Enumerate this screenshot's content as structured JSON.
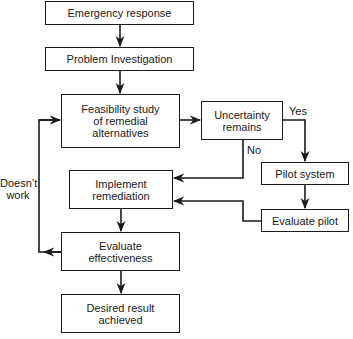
{
  "diagram": {
    "type": "flowchart",
    "nodes": {
      "emergency_response": "Emergency response",
      "problem_investigation": "Problem Investigation",
      "feasibility_study": "Feasibility study\nof remedial\nalternatives",
      "uncertainty_remains": "Uncertainty\nremains",
      "pilot_system": "Pilot system",
      "evaluate_pilot": "Evaluate pilot",
      "implement_remediation": "Implement\nremediation",
      "evaluate_effectiveness": "Evaluate\neffectiveness",
      "desired_result": "Desired result\nachieved"
    },
    "edge_labels": {
      "yes": "Yes",
      "no": "No",
      "doesnt_work": "Doesn’t\nwork"
    },
    "edges": [
      {
        "from": "Emergency response",
        "to": "Problem Investigation"
      },
      {
        "from": "Problem Investigation",
        "to": "Feasibility study of remedial alternatives"
      },
      {
        "from": "Feasibility study of remedial alternatives",
        "to": "Uncertainty remains"
      },
      {
        "from": "Uncertainty remains",
        "to": "Pilot system",
        "label": "Yes"
      },
      {
        "from": "Uncertainty remains",
        "to": "Implement remediation",
        "label": "No"
      },
      {
        "from": "Pilot system",
        "to": "Evaluate pilot"
      },
      {
        "from": "Evaluate pilot",
        "to": "Implement remediation"
      },
      {
        "from": "Implement remediation",
        "to": "Evaluate effectiveness"
      },
      {
        "from": "Evaluate effectiveness",
        "to": "Desired result achieved"
      },
      {
        "from": "Evaluate effectiveness",
        "to": "Feasibility study of remedial alternatives",
        "label": "Doesn’t work"
      }
    ]
  }
}
